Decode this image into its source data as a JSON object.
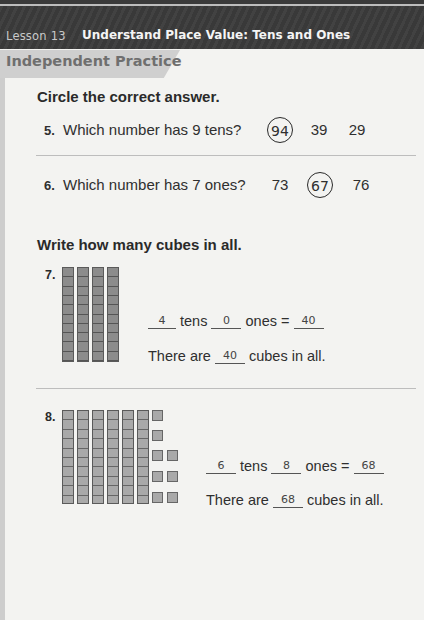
{
  "header": {
    "lesson_label": "Lesson 13",
    "lesson_title": "Understand Place Value: Tens and Ones"
  },
  "section": {
    "title": "Independent Practice"
  },
  "part1": {
    "instruction": "Circle the correct answer.",
    "questions": [
      {
        "number": "5.",
        "text": "Which number has 9 tens?",
        "choices": [
          "94",
          "39",
          "29"
        ],
        "circled_index": 0
      },
      {
        "number": "6.",
        "text": "Which number has 7 ones?",
        "choices": [
          "73",
          "67",
          "76"
        ],
        "circled_index": 1
      }
    ]
  },
  "part2": {
    "instruction": "Write how many cubes in all.",
    "items": [
      {
        "number": "7.",
        "tens_rods": 4,
        "ones_cubes": 0,
        "tens_answer": "4",
        "tens_label": "tens",
        "ones_answer": "0",
        "ones_label": "ones =",
        "total_answer": "40",
        "sentence_prefix": "There are",
        "sentence_answer": "40",
        "sentence_suffix": "cubes in all."
      },
      {
        "number": "8.",
        "tens_rods": 6,
        "ones_cubes": 8,
        "tens_answer": "6",
        "tens_label": "tens",
        "ones_answer": "8",
        "ones_label": "ones =",
        "total_answer": "68",
        "sentence_prefix": "There are",
        "sentence_answer": "68",
        "sentence_suffix": "cubes in all."
      }
    ]
  }
}
